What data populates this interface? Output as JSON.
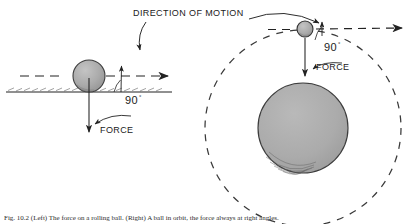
{
  "figure": {
    "title_label": "DIRECTION OF MOTION",
    "caption": "Fig. 10.2  (Left) The force on a rolling ball. (Right) A ball in orbit, the force always at right angles.",
    "colors": {
      "ink": "#222222",
      "ball_fill": "#a8a8a8",
      "planet_fill": "#a9a9a9",
      "ball_stroke": "#3a3a3a",
      "dash": "#3a3a3a",
      "background": "#ffffff"
    }
  },
  "left_panel": {
    "name": "rolling-ball-on-ground",
    "angle_label": "90",
    "degree_symbol": "°",
    "force_label": "FORCE",
    "motion_label": "DIRECTION OF MOTION",
    "ball": {
      "cx": 89,
      "cy": 76,
      "r": 16
    },
    "ground_y": 92,
    "motion_line_y": 76,
    "force_vector": {
      "x": 89,
      "y1": 78,
      "y2": 130
    }
  },
  "right_panel": {
    "name": "ball-in-orbit-around-planet",
    "angle_label": "90",
    "degree_symbol": "°",
    "force_label": "FORCE",
    "planet": {
      "cx": 303,
      "cy": 128,
      "r": 45
    },
    "orbit": {
      "cx": 303,
      "cy": 128,
      "r": 98
    },
    "orbiting_ball": {
      "cx": 305,
      "cy": 29,
      "r": 8
    },
    "force_vector": {
      "x": 305,
      "y1": 38,
      "y2": 74
    },
    "tangent_line_y": 29
  }
}
